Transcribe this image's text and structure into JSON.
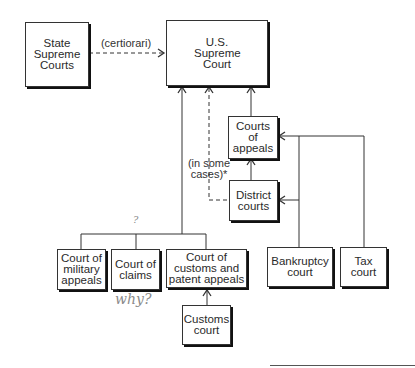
{
  "nodes": {
    "state_supreme": {
      "label": "State Supreme Courts"
    },
    "us_supreme": {
      "label": "U.S. Supreme Court"
    },
    "appeals": {
      "label": "Courts of appeals"
    },
    "district": {
      "label": "District courts"
    },
    "military": {
      "label": "Court of military appeals"
    },
    "claims": {
      "label": "Court of claims"
    },
    "customs_patent": {
      "label": "Court of customs and patent appeals"
    },
    "customs": {
      "label": "Customs court"
    },
    "bankruptcy": {
      "label": "Bankruptcy court"
    },
    "tax": {
      "label": "Tax court"
    }
  },
  "edge_labels": {
    "certiorari": "(certiorari)",
    "in_some_cases_1": "(in some",
    "in_some_cases_2": "cases)*"
  },
  "annotations": {
    "question_mark": "?",
    "why": "why?"
  },
  "edges": [
    {
      "from": "State Supreme Courts",
      "to": "U.S. Supreme Court",
      "style": "dashed",
      "label": "(certiorari)"
    },
    {
      "from": "Courts of appeals",
      "to": "U.S. Supreme Court",
      "style": "solid"
    },
    {
      "from": "District courts",
      "to": "U.S. Supreme Court",
      "style": "dashed",
      "label": "(in some cases)*"
    },
    {
      "from": "District courts",
      "to": "Courts of appeals",
      "style": "solid"
    },
    {
      "from": "Court of military appeals",
      "to": "U.S. Supreme Court",
      "style": "solid"
    },
    {
      "from": "Court of claims",
      "to": "U.S. Supreme Court",
      "style": "solid"
    },
    {
      "from": "Court of customs and patent appeals",
      "to": "U.S. Supreme Court",
      "style": "solid"
    },
    {
      "from": "Customs court",
      "to": "Court of customs and patent appeals",
      "style": "solid"
    },
    {
      "from": "Bankruptcy court",
      "to": "Courts of appeals",
      "style": "solid"
    },
    {
      "from": "Bankruptcy court",
      "to": "District courts",
      "style": "solid"
    },
    {
      "from": "Tax court",
      "to": "Courts of appeals",
      "style": "solid"
    }
  ]
}
